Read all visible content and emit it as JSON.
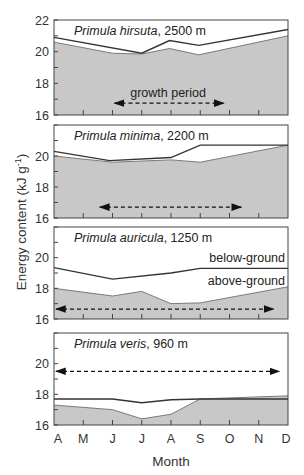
{
  "chart_data": {
    "type": "area",
    "xlabel": "Month",
    "ylabel": "Energy content (kJ g⁻¹)",
    "ylabel_main": "Energy content (kJ g",
    "ylabel_sup": "-1",
    "ylabel_close": ")",
    "categories": [
      "A",
      "M",
      "J",
      "J",
      "A",
      "S",
      "O",
      "N",
      "D"
    ],
    "ylim": [
      16,
      22
    ],
    "yticks": [
      16,
      18,
      20,
      22
    ],
    "colors": {
      "fill": "#c8c8c8",
      "line": "#333333",
      "fill_edge": "#7a7a7a"
    },
    "series_names": [
      "below-ground",
      "above-ground"
    ],
    "panels": [
      {
        "species": "Primula hirsuta",
        "elevation": ", 2500 m",
        "show_top_tick_label": true,
        "below_ground": {
          "x": [
            0,
            3,
            3.95,
            4.95,
            8
          ],
          "y": [
            20.9,
            19.9,
            20.7,
            20.4,
            21.4
          ]
        },
        "above_ground": {
          "x": [
            0,
            2,
            3,
            3.95,
            4.95,
            8
          ],
          "y": [
            20.6,
            19.9,
            19.85,
            20.2,
            19.8,
            21.0
          ]
        },
        "growth_period": {
          "from": 2,
          "to": 5.8,
          "y": 16.75,
          "label": "growth period"
        }
      },
      {
        "species": "Primula minima",
        "elevation": ", 2200 m",
        "show_top_tick_label": false,
        "below_ground": {
          "x": [
            0,
            1.9,
            4,
            5,
            8
          ],
          "y": [
            20.3,
            19.7,
            19.9,
            20.7,
            20.7
          ]
        },
        "above_ground": {
          "x": [
            0,
            2,
            4,
            5,
            8
          ],
          "y": [
            20.0,
            19.6,
            19.75,
            19.6,
            20.7
          ]
        },
        "growth_period": {
          "from": 1.5,
          "to": 6.4,
          "y": 16.7,
          "label": ""
        }
      },
      {
        "species": "Primula auricula",
        "elevation": ", 1250 m",
        "show_top_tick_label": false,
        "below_ground": {
          "x": [
            0,
            2,
            4,
            5,
            8
          ],
          "y": [
            19.35,
            18.6,
            19.0,
            19.3,
            19.3
          ]
        },
        "above_ground": {
          "x": [
            0,
            2,
            3,
            4,
            5,
            8
          ],
          "y": [
            18.0,
            17.5,
            17.8,
            17.0,
            17.05,
            18.1
          ]
        },
        "growth_period": {
          "from": 0,
          "to": 7.5,
          "y": 16.65,
          "label": ""
        },
        "series_labels": {
          "below": "below-ground",
          "above": "above-ground"
        }
      },
      {
        "species": "Primula veris",
        "elevation": ", 960 m",
        "show_top_tick_label": false,
        "below_ground": {
          "x": [
            0,
            2,
            3,
            4,
            5,
            8
          ],
          "y": [
            17.7,
            17.7,
            17.45,
            17.65,
            17.7,
            17.7
          ]
        },
        "above_ground": {
          "x": [
            0,
            2,
            3,
            4,
            5,
            8
          ],
          "y": [
            17.3,
            17.0,
            16.4,
            16.7,
            17.7,
            17.9
          ]
        },
        "growth_period": {
          "from": 0,
          "to": 7.7,
          "y": 19.5,
          "label": ""
        }
      }
    ]
  }
}
